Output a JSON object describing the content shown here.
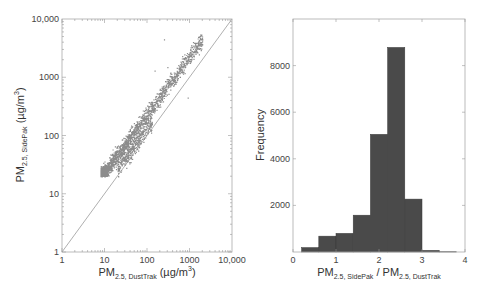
{
  "chart_data": [
    {
      "type": "scatter",
      "title": "",
      "xlabel": "PM2.5, DustTrak (µg/m3)",
      "xlabel_parts": {
        "main": "PM",
        "sub": "2.5, DustTrak",
        "unit": " (µg/m",
        "sup": "3",
        "close": ")"
      },
      "ylabel": "PM2.5, SidePak (µg/m3)",
      "ylabel_parts": {
        "main": "PM",
        "sub": "2.5, SidePak",
        "unit": " (µg/m",
        "sup": "3",
        "close": ")"
      },
      "xscale": "log",
      "yscale": "log",
      "xlim": [
        1,
        10000
      ],
      "ylim": [
        1,
        10000
      ],
      "xticks": [
        "1",
        "10",
        "100",
        "1000",
        "10,000"
      ],
      "yticks": [
        "1",
        "10",
        "100",
        "1000",
        "10,000"
      ],
      "grid": false,
      "reference_line": "1:1 line (y = x)",
      "point_color": "#8c8c8c",
      "line_color": "#9a9a9a",
      "clusters": [
        {
          "name": "main band",
          "x_range": [
            8,
            2000
          ],
          "y_range": [
            20,
            5000
          ],
          "approx_ratio": 2.2
        },
        {
          "name": "lower branch",
          "x_range": [
            20,
            400
          ],
          "y_range": [
            20,
            400
          ],
          "approx_ratio": 1.0
        }
      ],
      "outliers": [
        [
          250,
          4500
        ],
        [
          300,
          1500
        ],
        [
          150,
          1300
        ],
        [
          900,
          450
        ]
      ]
    },
    {
      "type": "bar",
      "subtype": "histogram",
      "title": "",
      "xlabel": "PM2.5, SidePak / PM2.5, DustTrak",
      "xlabel_parts": {
        "a_main": "PM",
        "a_sub": "2.5, SidePak",
        "sep": " / ",
        "b_main": "PM",
        "b_sub": "2.5, DustTrak"
      },
      "ylabel": "Frequency",
      "xlim": [
        0,
        4
      ],
      "ylim": [
        0,
        10000
      ],
      "xticks": [
        "0",
        "1",
        "2",
        "3",
        "4"
      ],
      "yticks": [
        "2000",
        "4000",
        "6000",
        "8000"
      ],
      "grid": false,
      "bar_color": "#4a4a4a",
      "bin_edges": [
        0.2,
        0.6,
        1.0,
        1.4,
        1.8,
        2.2,
        2.6,
        3.0,
        3.4,
        3.8
      ],
      "categories": [
        "0.2-0.6",
        "0.6-1.0",
        "1.0-1.4",
        "1.4-1.8",
        "1.8-2.2",
        "2.2-2.6",
        "2.6-3.0",
        "3.0-3.4",
        "3.4-3.8"
      ],
      "values": [
        190,
        680,
        800,
        1580,
        5050,
        8780,
        2270,
        70,
        10
      ]
    }
  ]
}
